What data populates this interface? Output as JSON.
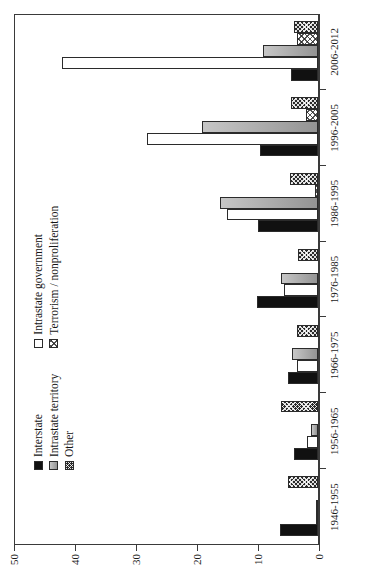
{
  "chart_data": {
    "type": "bar",
    "orientation": "vertical",
    "title": "",
    "xlabel": "",
    "ylabel": "",
    "ylim": [
      0,
      50
    ],
    "yticks": [
      0,
      10,
      20,
      30,
      40,
      50
    ],
    "ytick_labels": [
      "0",
      "10",
      "20",
      "30",
      "40",
      "50"
    ],
    "grid": false,
    "legend_position": "upper-left",
    "categories": [
      "1946-1955",
      "1956-1965",
      "1966-1975",
      "1976-1985",
      "1986-1995",
      "1996-2005",
      "2006-2012"
    ],
    "series": [
      {
        "name": "Interstate",
        "swatch": "sw-interstate",
        "color": "#111111",
        "values": [
          6.3,
          4.0,
          5.0,
          10.0,
          9.8,
          9.5,
          4.5
        ]
      },
      {
        "name": "Intrastate government",
        "swatch": "sw-intra-gov",
        "color": "#ffffff",
        "values": [
          0.3,
          1.8,
          3.5,
          5.5,
          15.0,
          28.0,
          42.0
        ]
      },
      {
        "name": "Intrastate territory",
        "swatch": "sw-intra-terr",
        "color": "#a8a8a8",
        "values": [
          0.4,
          1.2,
          4.3,
          6.0,
          16.0,
          19.0,
          9.0
        ]
      },
      {
        "name": "Terrorism / nonproliferation",
        "swatch": "sw-terror",
        "color": "#ffffff",
        "values": [
          0.0,
          0.0,
          0.0,
          0.0,
          0.5,
          2.0,
          3.5
        ]
      },
      {
        "name": "Other",
        "swatch": "sw-other",
        "color": "#2a2a2a",
        "values": [
          5.0,
          6.0,
          3.5,
          3.3,
          4.6,
          4.5,
          4.0
        ]
      }
    ]
  },
  "legend": {
    "columns": [
      [
        {
          "label": "Interstate",
          "swatch": "sw-interstate"
        },
        {
          "label": "Intrastate territory",
          "swatch": "sw-intra-terr"
        },
        {
          "label": "Other",
          "swatch": "sw-other"
        }
      ],
      [
        {
          "label": "Intrastate government",
          "swatch": "sw-intra-gov"
        },
        {
          "label": "Terrorism / nonproliferation",
          "swatch": "sw-terror"
        }
      ]
    ]
  }
}
